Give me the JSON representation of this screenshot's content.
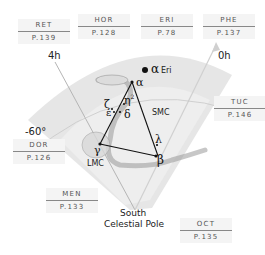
{
  "neighbors": [
    {
      "abbr": "RET",
      "page": "P.139"
    },
    {
      "abbr": "HOR",
      "page": "P.128"
    },
    {
      "abbr": "ERI",
      "page": "P.78"
    },
    {
      "abbr": "PHE",
      "page": "P.137"
    },
    {
      "abbr": "TUC",
      "page": "P.146"
    },
    {
      "abbr": "DOR",
      "page": "P.126"
    },
    {
      "abbr": "MEN",
      "page": "P.133"
    },
    {
      "abbr": "OCT",
      "page": "P.135"
    }
  ],
  "axes": {
    "ra_left": "4h",
    "ra_right": "0h",
    "declination": "-60°",
    "pole_line1": "South",
    "pole_line2": "Celestial Pole"
  },
  "stars": {
    "alpha_eri_symbol": "α",
    "alpha_eri_name": "Eri",
    "alpha": "α",
    "eta": "η",
    "eta_sup": "2",
    "zeta": "ζ",
    "epsilon": "ε",
    "delta": "δ",
    "gamma": "γ",
    "lambda": "λ",
    "beta": "β"
  },
  "objects": {
    "smc": "SMC",
    "lmc": "LMC"
  },
  "colors": {
    "wedge": "#e6e6e6",
    "wedge_inner": "#f2f2f2",
    "lines": "#111111",
    "grid": "#c8c8c8"
  }
}
